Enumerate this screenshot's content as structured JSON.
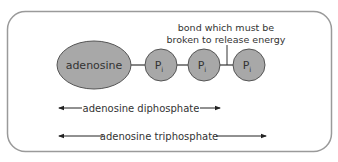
{
  "diagram": {
    "molecule": {
      "base_label": "adenosine",
      "phosphates": [
        {
          "label": "P",
          "subscript": "i"
        },
        {
          "label": "P",
          "subscript": "i"
        },
        {
          "label": "P",
          "subscript": "i"
        }
      ]
    },
    "annotation": {
      "line1": "bond which must be",
      "line2": "broken to release energy"
    },
    "spans": [
      {
        "label": "adenosine diphosphate"
      },
      {
        "label": "adenosine triphosphate"
      }
    ],
    "colors": {
      "shape_fill": "#a8a8a8",
      "shape_stroke": "#555555",
      "frame_stroke": "#9a9a9a",
      "text": "#333333"
    }
  }
}
